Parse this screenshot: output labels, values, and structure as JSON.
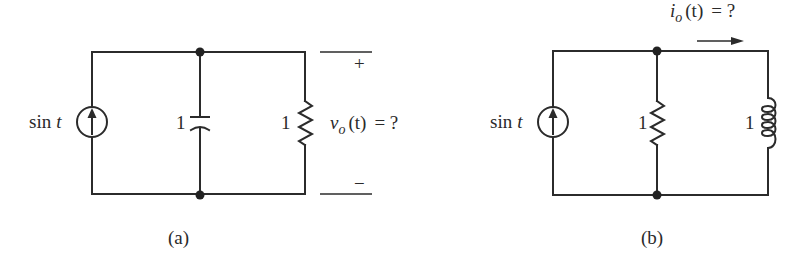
{
  "circuits": [
    {
      "id": "a",
      "caption": "(a)",
      "source": {
        "type": "current-source",
        "label": "sin t",
        "label_fn": "sin",
        "label_var": "t",
        "direction": "up"
      },
      "capacitor": {
        "value": "1"
      },
      "resistor": {
        "value": "1"
      },
      "output": {
        "plus": "+",
        "minus": "−",
        "var": "v",
        "sub": "o",
        "arg": "(t)",
        "eq": "= ?"
      }
    },
    {
      "id": "b",
      "caption": "(b)",
      "source": {
        "type": "current-source",
        "label": "sin t",
        "label_fn": "sin",
        "label_var": "t",
        "direction": "up"
      },
      "resistor": {
        "value": "1"
      },
      "inductor": {
        "value": "1"
      },
      "output": {
        "var": "i",
        "sub": "o",
        "arg": "(t)",
        "eq": "= ?",
        "arrow": "right"
      }
    }
  ]
}
